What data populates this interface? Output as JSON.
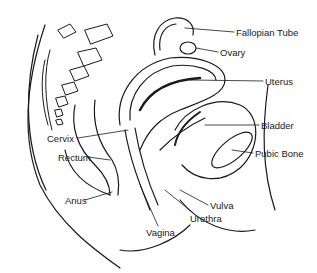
{
  "diagram": {
    "labels": [
      {
        "id": "fallopian-tube",
        "text": "Fallopian Tube",
        "x": 236,
        "y": 28
      },
      {
        "id": "ovary",
        "text": "Ovary",
        "x": 220,
        "y": 48
      },
      {
        "id": "uterus",
        "text": "Uterus",
        "x": 265,
        "y": 77
      },
      {
        "id": "bladder",
        "text": "Bladder",
        "x": 261,
        "y": 121
      },
      {
        "id": "pubic-bone",
        "text": "Pubic Bone",
        "x": 255,
        "y": 149
      },
      {
        "id": "cervix",
        "text": "Cervix",
        "x": 47,
        "y": 134
      },
      {
        "id": "rectum",
        "text": "Rectum",
        "x": 58,
        "y": 153
      },
      {
        "id": "anus",
        "text": "Anus",
        "x": 65,
        "y": 196
      },
      {
        "id": "vulva",
        "text": "Vulva",
        "x": 210,
        "y": 201
      },
      {
        "id": "urethra",
        "text": "Urethra",
        "x": 190,
        "y": 214
      },
      {
        "id": "vagina",
        "text": "Vagina",
        "x": 146,
        "y": 228
      }
    ]
  }
}
